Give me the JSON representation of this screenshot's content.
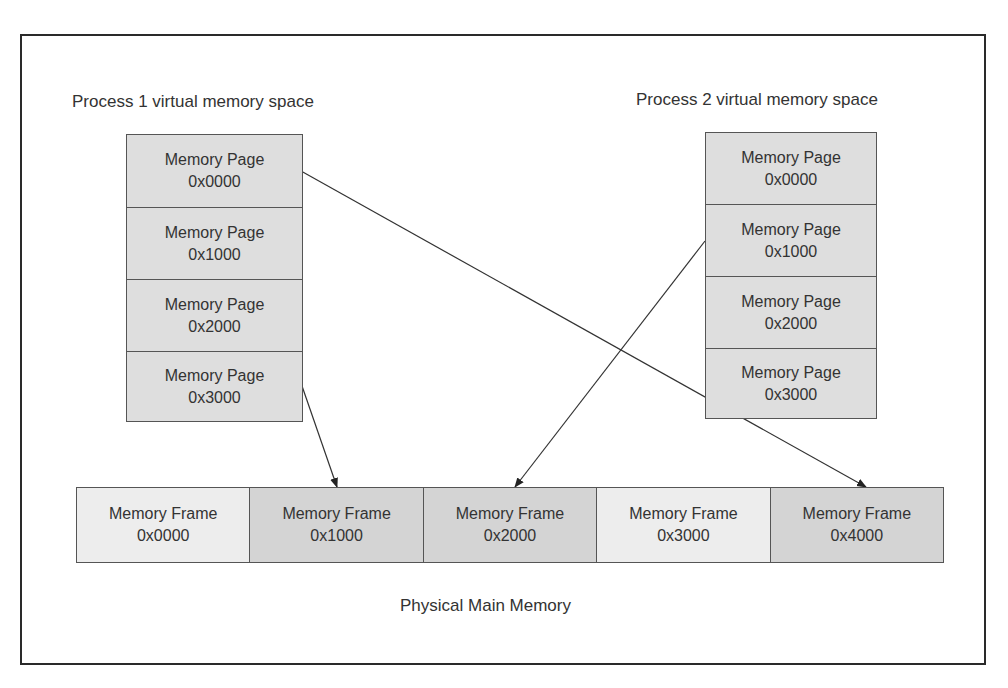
{
  "diagram": {
    "process1": {
      "title": "Process 1 virtual memory space",
      "pages": [
        {
          "label": "Memory Page",
          "address": "0x0000"
        },
        {
          "label": "Memory Page",
          "address": "0x1000"
        },
        {
          "label": "Memory Page",
          "address": "0x2000"
        },
        {
          "label": "Memory Page",
          "address": "0x3000"
        }
      ]
    },
    "process2": {
      "title": "Process 2 virtual memory space",
      "pages": [
        {
          "label": "Memory Page",
          "address": "0x0000"
        },
        {
          "label": "Memory Page",
          "address": "0x1000"
        },
        {
          "label": "Memory Page",
          "address": "0x2000"
        },
        {
          "label": "Memory Page",
          "address": "0x3000"
        }
      ]
    },
    "physical": {
      "title": "Physical Main Memory",
      "frames": [
        {
          "label": "Memory Frame",
          "address": "0x0000",
          "mapped": false
        },
        {
          "label": "Memory Frame",
          "address": "0x1000",
          "mapped": true
        },
        {
          "label": "Memory Frame",
          "address": "0x2000",
          "mapped": true
        },
        {
          "label": "Memory Frame",
          "address": "0x3000",
          "mapped": false
        },
        {
          "label": "Memory Frame",
          "address": "0x4000",
          "mapped": true
        }
      ]
    },
    "mappings": [
      {
        "from": "Process 1 page 0x0000",
        "to": "Frame 0x4000"
      },
      {
        "from": "Process 1 page 0x3000",
        "to": "Frame 0x1000"
      },
      {
        "from": "Process 2 page 0x1000",
        "to": "Frame 0x2000"
      }
    ],
    "colors": {
      "page_fill": "#dedede",
      "frame_mapped_fill": "#d4d4d4",
      "frame_unmapped_fill": "#ededed",
      "border": "#555555",
      "outer_border": "#2a2a2a",
      "text": "#333333"
    }
  }
}
